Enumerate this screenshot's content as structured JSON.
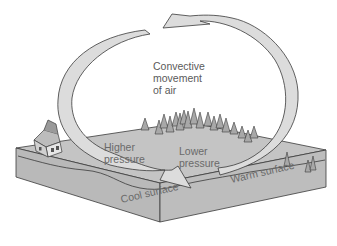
{
  "diagram": {
    "title_lines": [
      "Convective",
      "movement",
      "of air"
    ],
    "labels": {
      "higher_pressure": [
        "Higher",
        "pressure"
      ],
      "lower_pressure": [
        "Lower",
        "pressure"
      ],
      "cool_surface": "Cool surface",
      "warm_surface": "Warm surface"
    },
    "elements": {
      "left_arrow": "descending air arrow (cool side)",
      "right_arrow": "rising air arrow (warm side)",
      "house": "house on cool side",
      "forest": "cluster of conifer trees",
      "ground_block": "land surface block"
    },
    "colors": {
      "ground_top": "#c4c4c4",
      "ground_front": "#b8b8b8",
      "ground_side": "#a9a9a9",
      "arrow_fill": "#dcdcdc",
      "stroke": "#3a3a3a",
      "text": "#6a6a6a"
    }
  }
}
